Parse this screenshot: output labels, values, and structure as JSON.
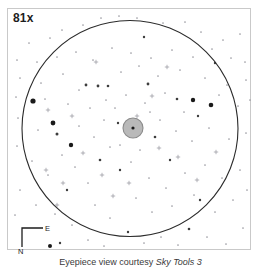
{
  "view": {
    "name": "eyepiece-view",
    "magnification_label": "81x",
    "background_color": "#ffffff",
    "frame_border_color": "#c9c9c9",
    "fov_circle": {
      "cx": 130,
      "cy": 128.5,
      "r": 108,
      "stroke": "#2b2b2b",
      "stroke_width": 1.1
    },
    "target_object": {
      "name": "central-nebula-disk",
      "cx": 133,
      "cy": 128,
      "r": 10,
      "fill": "#b9b9b9",
      "stroke": "#8a8a8a",
      "core_dot_r": 1.6,
      "core_color": "#1a1a1a"
    }
  },
  "compass": {
    "name": "compass-rose",
    "east_label": "E",
    "north_label": "N",
    "stroke": "#1d1d1d",
    "corner_x": 22,
    "corner_y": 228,
    "arm_east_x": 43,
    "arm_north_y": 247
  },
  "caption": {
    "prefix": "Eyepiece view courtesy ",
    "source": "Sky Tools 3"
  },
  "stars": {
    "bright": [
      {
        "x": 33,
        "y": 101,
        "r": 2.6
      },
      {
        "x": 53,
        "y": 123,
        "r": 2.4
      },
      {
        "x": 71,
        "y": 145,
        "r": 2.2
      },
      {
        "x": 193,
        "y": 100,
        "r": 2.2
      },
      {
        "x": 211,
        "y": 105,
        "r": 2.3
      },
      {
        "x": 50,
        "y": 246,
        "r": 2.0
      }
    ],
    "medium": [
      {
        "x": 57,
        "y": 134,
        "r": 1.5
      },
      {
        "x": 86,
        "y": 85,
        "r": 1.4
      },
      {
        "x": 98,
        "y": 86,
        "r": 1.4
      },
      {
        "x": 108,
        "y": 86,
        "r": 1.3
      },
      {
        "x": 148,
        "y": 84,
        "r": 1.4
      },
      {
        "x": 177,
        "y": 99,
        "r": 1.3
      },
      {
        "x": 118,
        "y": 123,
        "r": 1.2
      },
      {
        "x": 155,
        "y": 137,
        "r": 1.3
      },
      {
        "x": 100,
        "y": 160,
        "r": 1.3
      },
      {
        "x": 120,
        "y": 170,
        "r": 1.2
      },
      {
        "x": 170,
        "y": 160,
        "r": 1.2
      },
      {
        "x": 198,
        "y": 116,
        "r": 1.2
      },
      {
        "x": 67,
        "y": 190,
        "r": 1.2
      },
      {
        "x": 200,
        "y": 200,
        "r": 1.2
      },
      {
        "x": 189,
        "y": 229,
        "r": 1.3
      },
      {
        "x": 128,
        "y": 232,
        "r": 1.2
      },
      {
        "x": 60,
        "y": 243,
        "r": 1.2
      },
      {
        "x": 144,
        "y": 37,
        "r": 1.2
      },
      {
        "x": 215,
        "y": 63,
        "r": 1.2
      }
    ],
    "faint": [
      {
        "x": 29,
        "y": 43
      },
      {
        "x": 62,
        "y": 30
      },
      {
        "x": 50,
        "y": 38
      },
      {
        "x": 83,
        "y": 25
      },
      {
        "x": 101,
        "y": 18
      },
      {
        "x": 119,
        "y": 16
      },
      {
        "x": 137,
        "y": 18
      },
      {
        "x": 163,
        "y": 23
      },
      {
        "x": 185,
        "y": 22
      },
      {
        "x": 201,
        "y": 32
      },
      {
        "x": 223,
        "y": 40
      },
      {
        "x": 240,
        "y": 34
      },
      {
        "x": 17,
        "y": 60
      },
      {
        "x": 37,
        "y": 62
      },
      {
        "x": 57,
        "y": 57
      },
      {
        "x": 76,
        "y": 52
      },
      {
        "x": 93,
        "y": 60
      },
      {
        "x": 112,
        "y": 48
      },
      {
        "x": 131,
        "y": 53
      },
      {
        "x": 151,
        "y": 58
      },
      {
        "x": 172,
        "y": 50
      },
      {
        "x": 193,
        "y": 57
      },
      {
        "x": 212,
        "y": 49
      },
      {
        "x": 231,
        "y": 58
      },
      {
        "x": 245,
        "y": 62
      },
      {
        "x": 20,
        "y": 78
      },
      {
        "x": 41,
        "y": 83
      },
      {
        "x": 63,
        "y": 74
      },
      {
        "x": 79,
        "y": 90
      },
      {
        "x": 121,
        "y": 72
      },
      {
        "x": 139,
        "y": 66
      },
      {
        "x": 158,
        "y": 76
      },
      {
        "x": 180,
        "y": 70
      },
      {
        "x": 205,
        "y": 78
      },
      {
        "x": 227,
        "y": 85
      },
      {
        "x": 246,
        "y": 80
      },
      {
        "x": 16,
        "y": 97
      },
      {
        "x": 45,
        "y": 99
      },
      {
        "x": 68,
        "y": 104
      },
      {
        "x": 90,
        "y": 108
      },
      {
        "x": 106,
        "y": 100
      },
      {
        "x": 126,
        "y": 95
      },
      {
        "x": 145,
        "y": 103
      },
      {
        "x": 165,
        "y": 93
      },
      {
        "x": 184,
        "y": 112
      },
      {
        "x": 219,
        "y": 95
      },
      {
        "x": 238,
        "y": 106
      },
      {
        "x": 250,
        "y": 100
      },
      {
        "x": 18,
        "y": 118
      },
      {
        "x": 38,
        "y": 130
      },
      {
        "x": 62,
        "y": 155
      },
      {
        "x": 79,
        "y": 126
      },
      {
        "x": 94,
        "y": 137
      },
      {
        "x": 110,
        "y": 147
      },
      {
        "x": 140,
        "y": 150
      },
      {
        "x": 160,
        "y": 120
      },
      {
        "x": 176,
        "y": 131
      },
      {
        "x": 192,
        "y": 141
      },
      {
        "x": 209,
        "y": 128
      },
      {
        "x": 229,
        "y": 139
      },
      {
        "x": 246,
        "y": 133
      },
      {
        "x": 17,
        "y": 146
      },
      {
        "x": 32,
        "y": 161
      },
      {
        "x": 48,
        "y": 175
      },
      {
        "x": 75,
        "y": 167
      },
      {
        "x": 88,
        "y": 183
      },
      {
        "x": 131,
        "y": 162
      },
      {
        "x": 149,
        "y": 178
      },
      {
        "x": 166,
        "y": 188
      },
      {
        "x": 185,
        "y": 173
      },
      {
        "x": 205,
        "y": 165
      },
      {
        "x": 222,
        "y": 178
      },
      {
        "x": 240,
        "y": 170
      },
      {
        "x": 20,
        "y": 190
      },
      {
        "x": 36,
        "y": 205
      },
      {
        "x": 55,
        "y": 214
      },
      {
        "x": 72,
        "y": 225
      },
      {
        "x": 95,
        "y": 205
      },
      {
        "x": 110,
        "y": 218
      },
      {
        "x": 136,
        "y": 198
      },
      {
        "x": 152,
        "y": 212
      },
      {
        "x": 172,
        "y": 206
      },
      {
        "x": 194,
        "y": 195
      },
      {
        "x": 215,
        "y": 212
      },
      {
        "x": 233,
        "y": 200
      },
      {
        "x": 247,
        "y": 190
      },
      {
        "x": 88,
        "y": 240
      },
      {
        "x": 104,
        "y": 246
      },
      {
        "x": 144,
        "y": 243
      },
      {
        "x": 161,
        "y": 237
      },
      {
        "x": 178,
        "y": 245
      },
      {
        "x": 207,
        "y": 237
      },
      {
        "x": 226,
        "y": 244
      },
      {
        "x": 243,
        "y": 228
      },
      {
        "x": 15,
        "y": 215
      },
      {
        "x": 115,
        "y": 108
      },
      {
        "x": 150,
        "y": 112
      },
      {
        "x": 120,
        "y": 145
      },
      {
        "x": 104,
        "y": 120
      }
    ],
    "plus_markers": [
      {
        "x": 46,
        "y": 170
      },
      {
        "x": 63,
        "y": 183
      },
      {
        "x": 102,
        "y": 175
      },
      {
        "x": 137,
        "y": 116
      },
      {
        "x": 159,
        "y": 148
      },
      {
        "x": 113,
        "y": 196
      },
      {
        "x": 178,
        "y": 157
      },
      {
        "x": 57,
        "y": 205
      },
      {
        "x": 83,
        "y": 153
      },
      {
        "x": 129,
        "y": 183
      },
      {
        "x": 197,
        "y": 180
      },
      {
        "x": 216,
        "y": 152
      },
      {
        "x": 48,
        "y": 110
      },
      {
        "x": 152,
        "y": 96
      },
      {
        "x": 167,
        "y": 67
      },
      {
        "x": 96,
        "y": 62
      },
      {
        "x": 72,
        "y": 116
      }
    ],
    "color_bright": "#1a1a1a",
    "color_medium": "#3d3d3d",
    "color_faint": "#9a9aa0",
    "color_plus": "#8d8d95"
  }
}
